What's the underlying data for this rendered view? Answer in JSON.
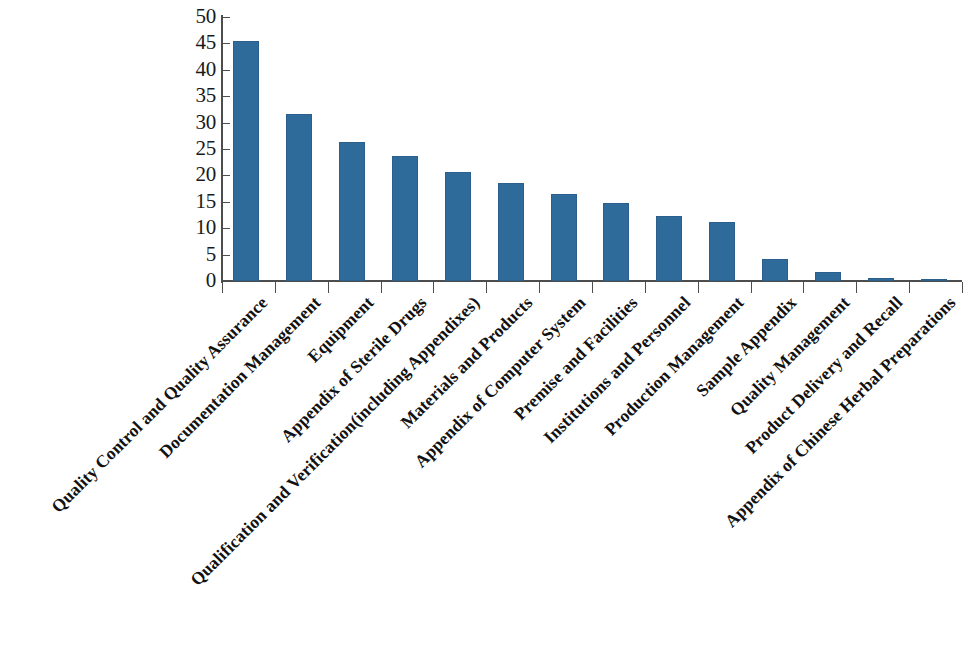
{
  "chart_data": {
    "type": "bar",
    "title": "",
    "subtitle": "",
    "xlabel": "",
    "ylabel": "",
    "ylim": [
      0,
      50
    ],
    "yticks": [
      0,
      5,
      10,
      15,
      20,
      25,
      30,
      35,
      40,
      45,
      50
    ],
    "ytick_labels": [
      "0",
      "5",
      "10",
      "15",
      "20",
      "25",
      "30",
      "35",
      "40",
      "45",
      "50"
    ],
    "grid": false,
    "legend": false,
    "bar_color": "#2f6b9a",
    "axis_color": "#4d4d4d",
    "categories": [
      "Quality Control and Quality Assurance",
      "Documentation Management",
      "Equipment",
      "Appendix of Sterile Drugs",
      "Qualification and Verification(including Appendixes)",
      "Materials and Products",
      "Appendix of Computer System",
      "Premise and Facilities",
      "Institutions and Personnel",
      "Production Management",
      "Sample Appendix",
      "Quality Management",
      "Product Delivery and Recall",
      "Appendix of Chinese Herbal Preparations"
    ],
    "values": [
      45.5,
      31.6,
      26.4,
      23.6,
      20.6,
      18.5,
      16.4,
      14.7,
      12.3,
      11.2,
      4.2,
      1.7,
      0.5,
      0.4
    ]
  }
}
